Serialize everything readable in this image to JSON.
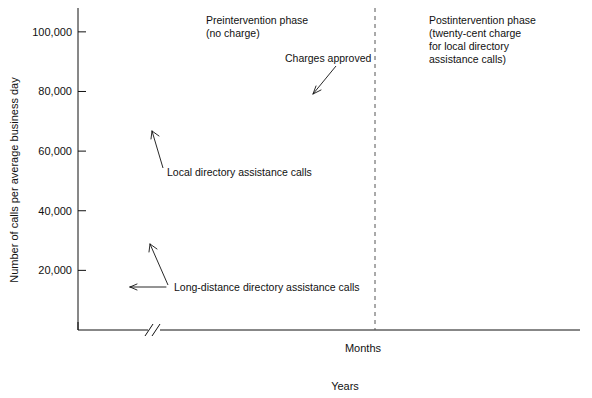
{
  "figure": {
    "ylabel": "Number of calls per average business day",
    "xlabel_months": "Months",
    "xlabel_years": "Years"
  },
  "annotations": {
    "preintervention": "Preintervention phase\n(no charge)",
    "preintervention_line1": "Preintervention phase",
    "preintervention_line2": "(no charge)",
    "postintervention_line1": "Postintervention phase",
    "postintervention_line2": "(twenty-cent charge",
    "postintervention_line3": "for local directory",
    "postintervention_line4": "assistance calls)",
    "charges_approved": "Charges approved",
    "local_series_label": "Local directory assistance calls",
    "longdistance_series_label": "Long-distance directory assistance calls"
  },
  "axes": {
    "y_ticks": [
      "20,000",
      "40,000",
      "60,000",
      "80,000",
      "100,000"
    ],
    "y_tick_values": [
      20000,
      40000,
      60000,
      80000,
      100000
    ],
    "y_min": 0,
    "y_max": 108000,
    "x_ticks_months": [
      "0",
      "12",
      "120",
      "132",
      "144",
      "156",
      "168",
      "180"
    ],
    "x_tick_values": [
      0,
      12,
      120,
      132,
      144,
      156,
      168,
      180
    ],
    "x_years": [
      "1962",
      "1971",
      "1972",
      "1973",
      "1974",
      "1975",
      "1976"
    ],
    "x_year_positions": [
      6,
      66,
      126,
      138,
      150,
      162,
      174
    ],
    "axis_break_at": 17,
    "phase_divider_month": 147.5
  },
  "chart_data": {
    "type": "line",
    "title": "",
    "subtitle": "",
    "xlabel": "Months",
    "ylabel": "Number of calls per average business day",
    "xlim": [
      0,
      180
    ],
    "ylim": [
      0,
      108000
    ],
    "grid": false,
    "legend_position": "none",
    "axis_break": {
      "present": true,
      "between_months": [
        13,
        118
      ]
    },
    "phase_divider": {
      "month": 147.5,
      "style": "dashed"
    },
    "annotations": [
      {
        "text": "Preintervention phase (no charge)",
        "month": 128,
        "value": 103000
      },
      {
        "text": "Postintervention phase (twenty-cent charge for local directory assistance calls)",
        "month": 158,
        "value": 103000
      },
      {
        "text": "Charges approved",
        "month": 139,
        "value": 90000
      },
      {
        "text": "Local directory assistance calls",
        "month": 126,
        "value": 52000
      },
      {
        "text": "Long-distance directory assistance calls",
        "month": 132,
        "value": 11500
      }
    ],
    "series": [
      {
        "name": "Local directory assistance calls",
        "marker": "open-circle",
        "segments": [
          {
            "phase": "preintervention-1962",
            "x": [
              1,
              2,
              3,
              4,
              5,
              6,
              7,
              8,
              9,
              10,
              11,
              12,
              13
            ],
            "values": [
              36500,
              35700,
              36800,
              38100,
              36600,
              35600,
              34600,
              34100,
              35000,
              35600,
              34700,
              36200,
              39700
            ]
          },
          {
            "phase": "preintervention-1971-1973",
            "x": [
              118,
              119,
              120,
              121,
              122,
              123,
              124,
              125,
              126,
              127,
              128,
              129,
              130,
              131,
              132,
              133,
              134,
              135,
              136,
              137,
              138,
              139,
              140,
              141,
              142,
              143,
              144,
              145,
              146
            ],
            "values": [
              67200,
              70400,
              70900,
              70600,
              70900,
              71100,
              71000,
              64900,
              65400,
              66900,
              68800,
              70800,
              75800,
              70800,
              70100,
              72900,
              73300,
              71900,
              72600,
              70400,
              75700,
              74000,
              79300,
              77200,
              83600,
              85800,
              85000,
              78000,
              74600
            ]
          },
          {
            "phase": "preintervention-tail",
            "x": [
              146,
              147,
              148,
              149
            ],
            "values": [
              74600,
              61000,
              60900,
              68200
            ]
          },
          {
            "phase": "postintervention-drop",
            "x": [
              149,
              150
            ],
            "values": [
              68200,
              53300
            ]
          },
          {
            "phase": "postintervention",
            "x": [
              150,
              151,
              152,
              153,
              154,
              155,
              156,
              157,
              158,
              159,
              160,
              161,
              162,
              163,
              164,
              165,
              166,
              167,
              168,
              169,
              170,
              171,
              172,
              173,
              174,
              175,
              176,
              177,
              178,
              179,
              180
            ],
            "values": [
              17300,
              16200,
              17000,
              18500,
              17300,
              16900,
              17700,
              18900,
              18100,
              17600,
              18600,
              20300,
              19300,
              18700,
              19500,
              21100,
              20200,
              19700,
              20500,
              22000,
              21000,
              20400,
              21300,
              23300,
              21600,
              20900,
              21800,
              23200,
              22400,
              22900,
              23400
            ]
          }
        ]
      },
      {
        "name": "Long-distance directory assistance calls",
        "marker": "filled-circle",
        "segments": [
          {
            "phase": "preintervention-1962",
            "x": [
              1,
              2,
              3,
              4,
              5,
              6,
              7,
              8,
              9,
              10,
              11,
              12,
              13
            ],
            "values": [
              11000,
              11400,
              12200,
              12700,
              13000,
              13300,
              13100,
              12600,
              12800,
              12200,
              11300,
              11500,
              12700
            ]
          },
          {
            "phase": "preintervention-1971-1973",
            "x": [
              118,
              119,
              120,
              121,
              122,
              123,
              124,
              125,
              126,
              127,
              128,
              129,
              130,
              131,
              132,
              133,
              134,
              135,
              136,
              137,
              138,
              139,
              140,
              141,
              142,
              143,
              144,
              145,
              146,
              147
            ],
            "values": [
              29800,
              27700,
              28500,
              28800,
              27800,
              29200,
              29800,
              28900,
              29800,
              29700,
              27200,
              28200,
              29700,
              29000,
              30500,
              31200,
              31900,
              32800,
              32500,
              31900,
              32400,
              33700,
              32700,
              32500,
              33100,
              32300,
              32800,
              33500,
              34100,
              34400
            ]
          },
          {
            "phase": "postintervention",
            "x": [
              150,
              151,
              152,
              153,
              154,
              155,
              156,
              157,
              158,
              159,
              160,
              161,
              162,
              163,
              164,
              165,
              166,
              167,
              168,
              169,
              170,
              171,
              172,
              173,
              174,
              175,
              176,
              177,
              178,
              179,
              180
            ],
            "values": [
              39500,
              38700,
              41000,
              40300,
              41700,
              41300,
              39400,
              37800,
              38300,
              40100,
              39800,
              38600,
              40500,
              41900,
              40500,
              44400,
              46000,
              44600,
              43800,
              43700,
              43500,
              45200,
              45600,
              45400,
              47500,
              50300,
              51400,
              49200,
              46500,
              43300,
              42000
            ]
          }
        ]
      }
    ]
  }
}
